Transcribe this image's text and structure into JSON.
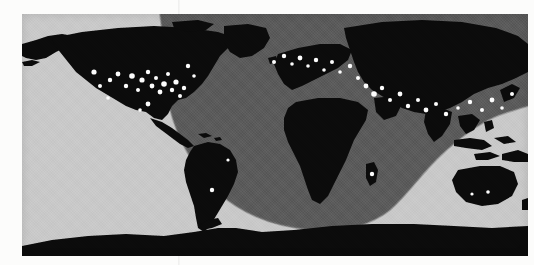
{
  "figure": {
    "kind": "world-map",
    "projection": "equirectangular",
    "caption": "",
    "colors": {
      "paper": "#fcfcfb",
      "ocean_day": "#c9c9c9",
      "ocean_night": "#5b5b5b",
      "land": "#0b0b0b",
      "land_night": "#090909",
      "city_light": "#fdfdfd",
      "terminator_edge": "#7a7a7a"
    },
    "legend_note": "",
    "bounds": {
      "left": 22,
      "top": 14,
      "width": 506,
      "height": 242
    }
  },
  "chart_data": {
    "type": "map",
    "title": "",
    "subtitle": "",
    "xlabel": "",
    "ylabel": "",
    "projection": "equirectangular",
    "lon_range": [
      -180,
      180
    ],
    "lat_range": [
      -90,
      90
    ],
    "grid": false,
    "legend": [],
    "layers": [
      {
        "name": "ocean-day",
        "shade": "light-gray",
        "value": "#c9c9c9"
      },
      {
        "name": "night-shadow",
        "shade": "mid-gray",
        "value": "#5b5b5b"
      },
      {
        "name": "landmass",
        "shade": "black",
        "value": "#0b0b0b"
      },
      {
        "name": "city-lights",
        "shade": "white",
        "value": "#fdfdfd"
      }
    ],
    "terminator": {
      "description": "Night shadow covers the entire northern band and bulges southward as a broad arc centred over Africa / the Atlantic.",
      "top_band_full_width": true,
      "arc_west_edge_lon": -125,
      "arc_east_edge_lon": 100,
      "arc_southern_extent_lat": -60,
      "arc_centre_lon": 15
    },
    "city_lights": [
      {
        "lon": -122,
        "lat": 45
      },
      {
        "lon": -118,
        "lat": 34
      },
      {
        "lon": -112,
        "lat": 41
      },
      {
        "lon": -105,
        "lat": 40
      },
      {
        "lon": -97,
        "lat": 33
      },
      {
        "lon": -95,
        "lat": 30
      },
      {
        "lon": -93,
        "lat": 45
      },
      {
        "lon": -90,
        "lat": 39
      },
      {
        "lon": -88,
        "lat": 42
      },
      {
        "lon": -84,
        "lat": 34
      },
      {
        "lon": -83,
        "lat": 42
      },
      {
        "lon": -80,
        "lat": 26
      },
      {
        "lon": -79,
        "lat": 44
      },
      {
        "lon": -77,
        "lat": 39
      },
      {
        "lon": -75,
        "lat": 40
      },
      {
        "lon": -74,
        "lat": 41
      },
      {
        "lon": -71,
        "lat": 42
      },
      {
        "lon": -73,
        "lat": 45
      },
      {
        "lon": -99,
        "lat": 19
      },
      {
        "lon": -58,
        "lat": -34
      },
      {
        "lon": -43,
        "lat": -23
      },
      {
        "lon": -3,
        "lat": 40
      },
      {
        "lon": 2,
        "lat": 48
      },
      {
        "lon": 0,
        "lat": 51
      },
      {
        "lon": 4,
        "lat": 52
      },
      {
        "lon": 9,
        "lat": 45
      },
      {
        "lon": 12,
        "lat": 41
      },
      {
        "lon": 13,
        "lat": 52
      },
      {
        "lon": 16,
        "lat": 48
      },
      {
        "lon": 21,
        "lat": 52
      },
      {
        "lon": 30,
        "lat": 50
      },
      {
        "lon": 37,
        "lat": 55
      },
      {
        "lon": 28,
        "lat": 41
      },
      {
        "lon": 35,
        "lat": 32
      },
      {
        "lon": 44,
        "lat": 33
      },
      {
        "lon": 51,
        "lat": 35
      },
      {
        "lon": 55,
        "lat": 25
      },
      {
        "lon": 67,
        "lat": 24
      },
      {
        "lon": 72,
        "lat": 19
      },
      {
        "lon": 77,
        "lat": 28
      },
      {
        "lon": 88,
        "lat": 22
      },
      {
        "lon": 100,
        "lat": 13
      },
      {
        "lon": 114,
        "lat": 22
      },
      {
        "lon": 121,
        "lat": 31
      },
      {
        "lon": 116,
        "lat": 39
      },
      {
        "lon": 127,
        "lat": 37
      },
      {
        "lon": 139,
        "lat": 35
      },
      {
        "lon": 135,
        "lat": 34
      },
      {
        "lon": 47,
        "lat": -19
      },
      {
        "lon": 151,
        "lat": -33
      },
      {
        "lon": 145,
        "lat": -37
      }
    ]
  }
}
